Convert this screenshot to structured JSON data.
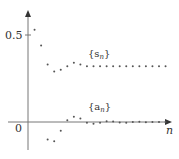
{
  "chart_data": {
    "type": "scatter",
    "title": "",
    "xlabel": "n",
    "ylabel": "",
    "y_ticks": [
      {
        "value": 0,
        "label": "0"
      },
      {
        "value": 0.5,
        "label": "0.5"
      }
    ],
    "grid": false,
    "legend_position": "inline labels",
    "series": [
      {
        "name": "{s_n}",
        "label": "{s",
        "label_sub": "n",
        "x": [
          1,
          2,
          3,
          4,
          5,
          6,
          7,
          8,
          9,
          10,
          11,
          12,
          13,
          14,
          15,
          16,
          17,
          18,
          19,
          20,
          21
        ],
        "values": [
          0.53,
          0.44,
          0.33,
          0.29,
          0.3,
          0.32,
          0.34,
          0.33,
          0.32,
          0.32,
          0.32,
          0.32,
          0.32,
          0.32,
          0.32,
          0.32,
          0.32,
          0.32,
          0.32,
          0.32,
          0.32
        ]
      },
      {
        "name": "{a_n}",
        "label": "{a",
        "label_sub": "n",
        "x": [
          3,
          4,
          5,
          6,
          7,
          8,
          9,
          10,
          11,
          12,
          13,
          14,
          15,
          16,
          17,
          18,
          19,
          20,
          21
        ],
        "values": [
          -0.1,
          -0.11,
          -0.05,
          0.01,
          0.03,
          0.02,
          -0.005,
          -0.01,
          -0.005,
          0.005,
          0.003,
          -0.003,
          -0.004,
          0.0,
          0.002,
          -0.002,
          0.0,
          0.0,
          0.0
        ]
      }
    ],
    "xlim": [
      0,
      23
    ],
    "ylim": [
      -0.16,
      0.63
    ]
  }
}
